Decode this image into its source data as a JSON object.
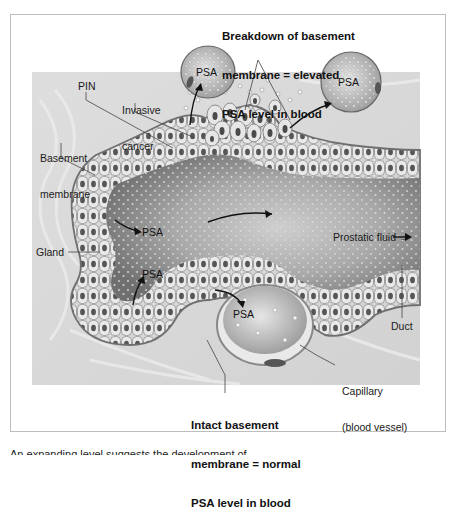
{
  "figure": {
    "top_callout": {
      "line1": "Breakdown of basement",
      "line2": "membrane = elevated",
      "line3": "PSA level in blood"
    },
    "bottom_callout": {
      "line1": "Intact basement",
      "line2": "membrane = normal",
      "line3": "PSA level in blood"
    },
    "labels": {
      "pin": "PIN",
      "invasive_1": "Invasive",
      "invasive_2": "cancer",
      "basement_1": "Basement",
      "basement_2": "membrane",
      "gland": "Gland",
      "prostatic_fluid": "Prostatic fluid →",
      "duct": "Duct",
      "capillary_1": "Capillary",
      "capillary_2": "(blood vessel)"
    },
    "psa_markers": [
      "PSA",
      "PSA",
      "PSA",
      "PSA",
      "PSA"
    ],
    "colors": {
      "background": "#ffffff",
      "tissue_bg": "#d9d9d9",
      "lumen": "#8a8a8a",
      "lumen_center": "#c8c8c8",
      "cell_fill": "#e4e4e4",
      "nucleus": "#555555",
      "membrane": "#7a7a7a",
      "frame_border": "#bdbdbd"
    }
  },
  "caption": {
    "text": "An expanding level suggests the development of..."
  }
}
